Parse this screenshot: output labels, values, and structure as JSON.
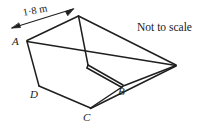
{
  "figure": {
    "kind": "geometry-diagram",
    "background_color": "#ffffff",
    "line_color": "#1a1a1a",
    "note": "Not to scale",
    "dimension": {
      "label": "1·8 m",
      "value": 1.8,
      "unit": "m",
      "decimal_separator": "middle-dot",
      "applies_to": "top edge from A to the rear top corner",
      "arrow_style": "double-headed"
    },
    "vertices": [
      {
        "id": "A",
        "label": "A",
        "role": "front-left top rim corner"
      },
      {
        "id": "B",
        "label": "B",
        "role": "right base corner"
      },
      {
        "id": "C",
        "label": "C",
        "role": "front base corner"
      },
      {
        "id": "D",
        "label": "D",
        "role": "front-left lower corner"
      }
    ],
    "labels": {
      "A": "A",
      "B": "B",
      "C": "C",
      "D": "D"
    }
  }
}
